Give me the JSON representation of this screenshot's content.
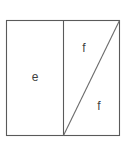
{
  "figure": {
    "type": "geometry-diagram",
    "canvas": {
      "width": 126,
      "height": 143,
      "background": "#ffffff"
    },
    "colors": {
      "outline": "#5a5a5a",
      "diagonal": "#6b6b6b",
      "label": "#3f3f3f",
      "fill": "#ffffff"
    },
    "outer_rect": {
      "x": 6.5,
      "y": 20.5,
      "width": 113,
      "height": 115
    },
    "divider": {
      "x": 63.5,
      "y1": 20.5,
      "y2": 135.5
    },
    "diagonal": {
      "x1": 63.5,
      "y1": 135.5,
      "x2": 119.5,
      "y2": 20.5
    },
    "labels": [
      {
        "name": "label-e",
        "text": "e",
        "x": 35,
        "y": 77
      },
      {
        "name": "label-f-upper",
        "text": "f",
        "x": 84,
        "y": 48
      },
      {
        "name": "label-f-lower",
        "text": "f",
        "x": 99,
        "y": 106
      }
    ]
  }
}
